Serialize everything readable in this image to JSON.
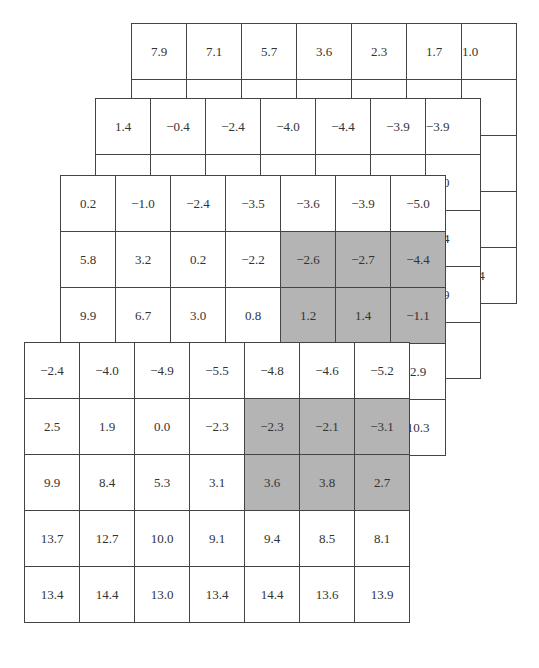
{
  "diagram": {
    "shade_color": "#b4b4b4",
    "layers": [
      {
        "name": "layer-1-back",
        "rows": [
          [
            "7.9",
            "7.1",
            "5.7",
            "3.6",
            "2.3",
            "1.7",
            "1.0"
          ],
          [
            null,
            null,
            null,
            null,
            null,
            null,
            "2.1"
          ],
          [
            null,
            null,
            null,
            null,
            null,
            null,
            "4.0"
          ],
          [
            null,
            null,
            null,
            null,
            null,
            null,
            "6.8"
          ],
          [
            null,
            null,
            null,
            null,
            null,
            null,
            "14.4"
          ]
        ],
        "shaded": []
      },
      {
        "name": "layer-2",
        "rows": [
          [
            "1.4",
            "−0.4",
            "−2.4",
            "−4.0",
            "−4.4",
            "−3.9",
            "−3.9"
          ],
          [
            null,
            null,
            null,
            null,
            null,
            null,
            "−6.0"
          ],
          [
            null,
            null,
            null,
            null,
            null,
            null,
            "−6.4"
          ],
          [
            null,
            null,
            null,
            null,
            null,
            null,
            "−2.9"
          ],
          [
            null,
            null,
            null,
            null,
            null,
            null,
            "6.6"
          ]
        ],
        "shaded": []
      },
      {
        "name": "layer-3",
        "rows": [
          [
            "0.2",
            "−1.0",
            "−2.4",
            "−3.5",
            "−3.6",
            "−3.9",
            "−5.0"
          ],
          [
            "5.8",
            "3.2",
            "0.2",
            "−2.2",
            "−2.6",
            "−2.7",
            "−4.4"
          ],
          [
            "9.9",
            "6.7",
            "3.0",
            "0.8",
            "1.2",
            "1.4",
            "−1.1"
          ],
          [
            null,
            null,
            null,
            null,
            null,
            null,
            "2.9"
          ],
          [
            null,
            null,
            null,
            null,
            null,
            null,
            "10.3"
          ]
        ],
        "shaded": [
          [
            1,
            4
          ],
          [
            1,
            5
          ],
          [
            1,
            6
          ],
          [
            2,
            4
          ],
          [
            2,
            5
          ],
          [
            2,
            6
          ]
        ]
      },
      {
        "name": "layer-4-front",
        "rows": [
          [
            "−2.4",
            "−4.0",
            "−4.9",
            "−5.5",
            "−4.8",
            "−4.6",
            "−5.2"
          ],
          [
            "2.5",
            "1.9",
            "0.0",
            "−2.3",
            "−2.3",
            "−2.1",
            "−3.1"
          ],
          [
            "9.9",
            "8.4",
            "5.3",
            "3.1",
            "3.6",
            "3.8",
            "2.7"
          ],
          [
            "13.7",
            "12.7",
            "10.0",
            "9.1",
            "9.4",
            "8.5",
            "8.1"
          ],
          [
            "13.4",
            "14.4",
            "13.0",
            "13.4",
            "14.4",
            "13.6",
            "13.9"
          ]
        ],
        "shaded": [
          [
            1,
            4
          ],
          [
            1,
            5
          ],
          [
            1,
            6
          ],
          [
            2,
            4
          ],
          [
            2,
            5
          ],
          [
            2,
            6
          ]
        ]
      }
    ]
  }
}
